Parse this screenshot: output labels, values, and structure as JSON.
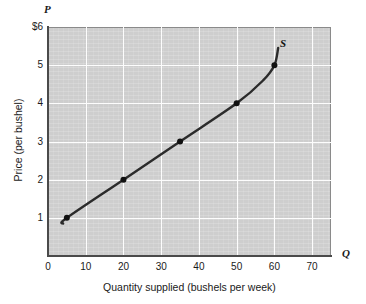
{
  "figure": {
    "background_color": "#ffffff",
    "plot_background_color": "#cecece",
    "gridline_color": "#ffffff",
    "curve_color": "#2b2b2b",
    "axis_color": "#4a4a4a"
  },
  "axes": {
    "y_variable": "P",
    "x_variable": "Q",
    "y_title": "Price (per bushel)",
    "x_title": "Quantity supplied (bushels per week)",
    "y_ticks": [
      "$6",
      "5",
      "4",
      "3",
      "2",
      "1"
    ],
    "x_ticks": [
      "0",
      "10",
      "20",
      "30",
      "40",
      "50",
      "60",
      "70"
    ]
  },
  "chart_data": {
    "type": "line",
    "title": "",
    "subtitle": "",
    "xlabel": "Quantity supplied (bushels per week)",
    "ylabel": "Price (per bushel)",
    "xlim": [
      0,
      75
    ],
    "ylim": [
      0,
      6
    ],
    "grid": true,
    "legend_position": "inline-right",
    "series": [
      {
        "name": "S",
        "label": "S",
        "marker": "filled-circle",
        "x": [
          4,
          5,
          20,
          35,
          50,
          57,
          60,
          61
        ],
        "y": [
          0.85,
          1.0,
          2.0,
          3.0,
          4.0,
          4.6,
          5.0,
          5.45
        ]
      }
    ],
    "marked_points": [
      {
        "x": 5,
        "y": 1
      },
      {
        "x": 20,
        "y": 2
      },
      {
        "x": 35,
        "y": 3
      },
      {
        "x": 50,
        "y": 4
      },
      {
        "x": 60,
        "y": 5
      }
    ],
    "annotations": [
      {
        "text": "S",
        "x": 62,
        "y": 5.55
      }
    ]
  }
}
